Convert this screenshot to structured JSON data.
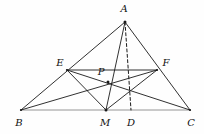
{
  "figure": {
    "type": "geometry-diagram",
    "width": 204,
    "height": 134,
    "background_color": "#fefefe",
    "stroke_color": "#1a1a1a",
    "base_line_color": "#8a8a8a",
    "stroke_width": 0.9
  },
  "points": {
    "A": {
      "label": "A",
      "x": 125,
      "y": 22,
      "label_x": 124,
      "label_y": 9
    },
    "B": {
      "label": "B",
      "x": 21,
      "y": 110,
      "label_x": 19,
      "label_y": 123
    },
    "C": {
      "label": "C",
      "x": 190,
      "y": 110,
      "label_x": 191,
      "label_y": 123
    },
    "D": {
      "label": "D",
      "x": 131,
      "y": 110,
      "label_x": 131,
      "label_y": 123
    },
    "E": {
      "label": "E",
      "x": 67,
      "y": 70,
      "label_x": 60,
      "label_y": 63
    },
    "F": {
      "label": "F",
      "x": 157,
      "y": 70,
      "label_x": 166,
      "label_y": 63
    },
    "M": {
      "label": "M",
      "x": 106,
      "y": 110,
      "label_x": 105,
      "label_y": 123
    },
    "P": {
      "label": "P",
      "x": 108,
      "y": 82,
      "label_x": 101,
      "label_y": 72
    }
  },
  "segments": [
    {
      "name": "side-AB",
      "from": "A",
      "to": "B",
      "style": "solid"
    },
    {
      "name": "side-AC",
      "from": "A",
      "to": "C",
      "style": "solid"
    },
    {
      "name": "side-BC",
      "from": "B",
      "to": "C",
      "style": "solid",
      "color": "#8a8a8a"
    },
    {
      "name": "cevian-AM",
      "from": "A",
      "to": "M",
      "style": "solid"
    },
    {
      "name": "altitude-AD",
      "from": "A",
      "to": "D",
      "style": "dashed"
    },
    {
      "name": "midsegment-EF",
      "from": "E",
      "to": "F",
      "style": "solid"
    },
    {
      "name": "segment-EM",
      "from": "E",
      "to": "M",
      "style": "solid"
    },
    {
      "name": "segment-EC",
      "from": "E",
      "to": "C",
      "style": "solid"
    },
    {
      "name": "segment-BF",
      "from": "B",
      "to": "F",
      "style": "solid"
    },
    {
      "name": "segment-MF",
      "from": "M",
      "to": "F",
      "style": "solid"
    }
  ],
  "labels_order": [
    "A",
    "E",
    "F",
    "P",
    "B",
    "M",
    "D",
    "C"
  ]
}
